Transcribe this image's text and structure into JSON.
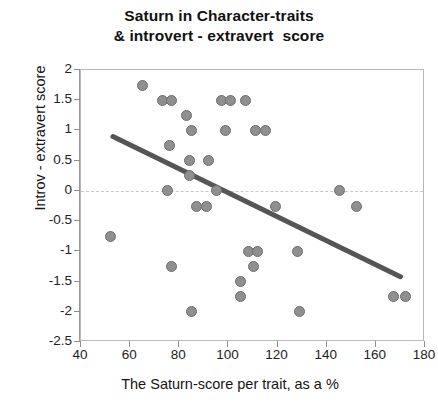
{
  "chart_data": {
    "type": "scatter",
    "title": "Saturn in Character-traits & introvert - extravert  score",
    "title_line1": "Saturn in Character-traits",
    "title_line2": "& introvert - extravert  score",
    "xlabel": "The Saturn-score per trait, as a %",
    "ylabel": "Introv - extravert score",
    "xlim": [
      40,
      180
    ],
    "ylim": [
      -2.5,
      2
    ],
    "xticks": [
      40,
      60,
      80,
      100,
      120,
      140,
      160,
      180
    ],
    "yticks": [
      2,
      1.5,
      1,
      0.5,
      0,
      -0.5,
      -1,
      -1.5,
      -2,
      -2.5
    ],
    "xtick_labels": [
      "40",
      "60",
      "80",
      "100",
      "120",
      "140",
      "160",
      "180"
    ],
    "ytick_labels": [
      "2",
      "1.5",
      "1",
      "0.5",
      "0",
      "-0.5",
      "-1",
      "-1.5",
      "-2",
      "-2.5"
    ],
    "grid": "zero-line-only",
    "legend": "none",
    "marker_color": "#8f8f8f",
    "marker_edge_color": "#6e6e6e",
    "trendline_color": "#555555",
    "series": [
      {
        "name": "Traits",
        "points": [
          [
            65,
            1.75
          ],
          [
            73,
            1.5
          ],
          [
            77,
            1.5
          ],
          [
            97,
            1.5
          ],
          [
            101,
            1.5
          ],
          [
            107,
            1.5
          ],
          [
            83,
            1.25
          ],
          [
            85,
            1.0
          ],
          [
            99,
            1.0
          ],
          [
            111,
            1.0
          ],
          [
            115,
            1.0
          ],
          [
            76,
            0.75
          ],
          [
            84,
            0.5
          ],
          [
            92,
            0.5
          ],
          [
            84,
            0.25
          ],
          [
            75,
            0.0
          ],
          [
            95,
            0.0
          ],
          [
            145,
            0.0
          ],
          [
            87,
            -0.25
          ],
          [
            91,
            -0.25
          ],
          [
            119,
            -0.25
          ],
          [
            152,
            -0.25
          ],
          [
            52,
            -0.75
          ],
          [
            108,
            -1.0
          ],
          [
            112,
            -1.0
          ],
          [
            128,
            -1.0
          ],
          [
            77,
            -1.25
          ],
          [
            110,
            -1.25
          ],
          [
            105,
            -1.5
          ],
          [
            105,
            -1.75
          ],
          [
            167,
            -1.75
          ],
          [
            172,
            -1.75
          ],
          [
            85,
            -2.0
          ],
          [
            129,
            -2.0
          ]
        ]
      }
    ],
    "trendline": {
      "x_start": 53,
      "y_start": 0.9,
      "x_end": 170,
      "y_end": -1.42
    }
  }
}
